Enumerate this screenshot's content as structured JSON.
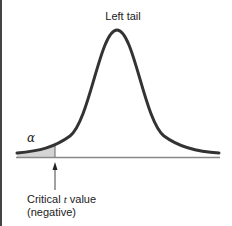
{
  "diagram": {
    "title": "Left tail",
    "alpha_label": "α",
    "critical_label_line1_prefix": "Critical ",
    "critical_label_italic": "t",
    "critical_label_line1_suffix": " value",
    "critical_label_line2": "(negative)",
    "colors": {
      "curve": "#333333",
      "shade": "#d4d4d4",
      "axis": "#888888",
      "border": "#444444"
    }
  }
}
